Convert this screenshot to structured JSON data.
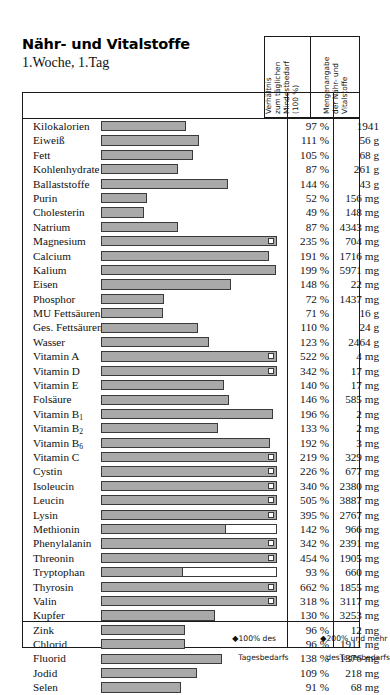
{
  "title": "Nähr- und Vitalstoffe",
  "subtitle": "1.Woche, 1.Tag",
  "columns": {
    "percent_header": "Verhältnis\nzum täglichen\nMindestbedarf\n(100 %)",
    "amount_header": "Mengenangabe\nder Nähr- und\nVitalstoffe"
  },
  "legend": {
    "marker_100": "◆",
    "text_100_line1": "100% des",
    "text_100_line2": "Tagesbedarfs",
    "marker_200": "◆",
    "text_200_line1": "200% und mehr",
    "text_200_line2": "desTagesbedarfs"
  },
  "colors": {
    "bar_fill": "#a9a9a9",
    "bar_stroke": "#3a3a3a",
    "frame": "#1a1a1a",
    "gridline": "#6b6b6b"
  },
  "chart_data": {
    "type": "bar",
    "title": "Nähr- und Vitalstoffe",
    "subtitle": "1.Woche, 1.Tag",
    "xlabel": "Verhältnis zum täglichen Mindestbedarf (100 %)",
    "ylabel": "",
    "xlim": [
      0,
      200
    ],
    "grid": true,
    "gridlines": [
      100,
      200
    ],
    "orientation": "horizontal",
    "categories": [
      "Kilokalorien",
      "Eiweiß",
      "Fett",
      "Kohlenhydrate",
      "Ballaststoffe",
      "Purin",
      "Cholesterin",
      "Natrium",
      "Magnesium",
      "Calcium",
      "Kalium",
      "Eisen",
      "Phosphor",
      "MU Fettsäuren",
      "Ges. Fettsäuren",
      "Wasser",
      "Vitamin A",
      "Vitamin D",
      "Vitamin E",
      "Folsäure",
      "Vitamin B1",
      "Vitamin B2",
      "Vitamin B6",
      "Vitamin C",
      "Cystin",
      "Isoleucin",
      "Leucin",
      "Lysin",
      "Methionin",
      "Phenylalanin",
      "Threonin",
      "Tryptophan",
      "Thyrosin",
      "Valin",
      "Kupfer",
      "Zink",
      "Chlorid",
      "Fluorid",
      "Jodid",
      "Selen"
    ],
    "values": [
      97,
      111,
      105,
      87,
      144,
      52,
      49,
      87,
      235,
      191,
      199,
      148,
      72,
      71,
      110,
      123,
      522,
      342,
      140,
      146,
      196,
      133,
      192,
      219,
      226,
      340,
      505,
      395,
      142,
      342,
      454,
      93,
      662,
      318,
      130,
      96,
      96,
      138,
      109,
      91
    ],
    "value_labels": [
      "97 %",
      "111 %",
      "105 %",
      "87 %",
      "144 %",
      "52 %",
      "49 %",
      "87 %",
      "235 %",
      "191 %",
      "199 %",
      "148 %",
      "72 %",
      "71 %",
      "110 %",
      "123 %",
      "522 %",
      "342 %",
      "140 %",
      "146 %",
      "196 %",
      "133 %",
      "192 %",
      "219 %",
      "226 %",
      "340 %",
      "505 %",
      "395 %",
      "142 %",
      "342 %",
      "454 %",
      "93 %",
      "662 %",
      "318 %",
      "130 %",
      "96 %",
      "96 %",
      "138 %",
      "109 %",
      "91 %"
    ],
    "amounts": [
      "1941",
      "56 g",
      "68 g",
      "261 g",
      "43 g",
      "156 mg",
      "148 mg",
      "4343 mg",
      "704 mg",
      "1716 mg",
      "5971 mg",
      "22 mg",
      "1437 mg",
      "16 g",
      "24 g",
      "2464 g",
      "4 mg",
      "17 mg",
      "17 mg",
      "585 mg",
      "2 mg",
      "2 mg",
      "3 mg",
      "329 mg",
      "677 mg",
      "2380 mg",
      "3887 mg",
      "2767 mg",
      "966 mg",
      "2391 mg",
      "1905 mg",
      "660 mg",
      "1855 mg",
      "3117 mg",
      "3253 mg",
      "12 mg",
      "1911 mg",
      "1376 mg",
      "218 mg",
      "68 mg"
    ]
  },
  "rows": [
    {
      "label": "Kilokalorien",
      "label_html": "Kilokalorien",
      "percent": 97,
      "percent_label": "97 %",
      "amount": "1941",
      "capped": false,
      "outline_full": false
    },
    {
      "label": "Eiweiß",
      "label_html": "Eiweiß",
      "percent": 111,
      "percent_label": "111 %",
      "amount": "56 g",
      "capped": false,
      "outline_full": false
    },
    {
      "label": "Fett",
      "label_html": "Fett",
      "percent": 105,
      "percent_label": "105 %",
      "amount": "68 g",
      "capped": false,
      "outline_full": false
    },
    {
      "label": "Kohlenhydrate",
      "label_html": "Kohlenhydrate",
      "percent": 87,
      "percent_label": "87 %",
      "amount": "261 g",
      "capped": false,
      "outline_full": false
    },
    {
      "label": "Ballaststoffe",
      "label_html": "Ballaststoffe",
      "percent": 144,
      "percent_label": "144 %",
      "amount": "43 g",
      "capped": false,
      "outline_full": false
    },
    {
      "label": "Purin",
      "label_html": "Purin",
      "percent": 52,
      "percent_label": "52 %",
      "amount": "156 mg",
      "capped": false,
      "outline_full": false
    },
    {
      "label": "Cholesterin",
      "label_html": "Cholesterin",
      "percent": 49,
      "percent_label": "49 %",
      "amount": "148 mg",
      "capped": false,
      "outline_full": false
    },
    {
      "label": "Natrium",
      "label_html": "Natrium",
      "percent": 87,
      "percent_label": "87 %",
      "amount": "4343 mg",
      "capped": false,
      "outline_full": false
    },
    {
      "label": "Magnesium",
      "label_html": "Magnesium",
      "percent": 235,
      "percent_label": "235 %",
      "amount": "704 mg",
      "capped": true,
      "outline_full": false
    },
    {
      "label": "Calcium",
      "label_html": "Calcium",
      "percent": 191,
      "percent_label": "191 %",
      "amount": "1716 mg",
      "capped": false,
      "outline_full": false
    },
    {
      "label": "Kalium",
      "label_html": "Kalium",
      "percent": 199,
      "percent_label": "199 %",
      "amount": "5971 mg",
      "capped": false,
      "outline_full": false
    },
    {
      "label": "Eisen",
      "label_html": "Eisen",
      "percent": 148,
      "percent_label": "148 %",
      "amount": "22 mg",
      "capped": false,
      "outline_full": false
    },
    {
      "label": "Phosphor",
      "label_html": "Phosphor",
      "percent": 72,
      "percent_label": "72 %",
      "amount": "1437 mg",
      "capped": false,
      "outline_full": false
    },
    {
      "label": "MU Fettsäuren",
      "label_html": "MU Fettsäuren",
      "percent": 71,
      "percent_label": "71 %",
      "amount": "16 g",
      "capped": false,
      "outline_full": false
    },
    {
      "label": "Ges. Fettsäuren",
      "label_html": "Ges. Fettsäuren",
      "percent": 110,
      "percent_label": "110 %",
      "amount": "24 g",
      "capped": false,
      "outline_full": false
    },
    {
      "label": "Wasser",
      "label_html": "Wasser",
      "percent": 123,
      "percent_label": "123 %",
      "amount": "2464 g",
      "capped": false,
      "outline_full": false
    },
    {
      "label": "Vitamin A",
      "label_html": "Vitamin A",
      "percent": 522,
      "percent_label": "522 %",
      "amount": "4 mg",
      "capped": true,
      "outline_full": false
    },
    {
      "label": "Vitamin D",
      "label_html": "Vitamin D",
      "percent": 342,
      "percent_label": "342 %",
      "amount": "17 mg",
      "capped": true,
      "outline_full": false
    },
    {
      "label": "Vitamin E",
      "label_html": "Vitamin E",
      "percent": 140,
      "percent_label": "140 %",
      "amount": "17 mg",
      "capped": false,
      "outline_full": false
    },
    {
      "label": "Folsäure",
      "label_html": "Folsäure",
      "percent": 146,
      "percent_label": "146 %",
      "amount": "585 mg",
      "capped": false,
      "outline_full": false
    },
    {
      "label": "Vitamin B1",
      "label_html": "Vitamin B<sub>1</sub>",
      "percent": 196,
      "percent_label": "196 %",
      "amount": "2 mg",
      "capped": false,
      "outline_full": false
    },
    {
      "label": "Vitamin B2",
      "label_html": "Vitamin B<sub>2</sub>",
      "percent": 133,
      "percent_label": "133 %",
      "amount": "2 mg",
      "capped": false,
      "outline_full": false
    },
    {
      "label": "Vitamin B6",
      "label_html": "Vitamin B<sub>6</sub>",
      "percent": 192,
      "percent_label": "192 %",
      "amount": "3 mg",
      "capped": false,
      "outline_full": false
    },
    {
      "label": "Vitamin C",
      "label_html": "Vitamin C",
      "percent": 219,
      "percent_label": "219 %",
      "amount": "329 mg",
      "capped": true,
      "outline_full": false
    },
    {
      "label": "Cystin",
      "label_html": "Cystin",
      "percent": 226,
      "percent_label": "226 %",
      "amount": "677 mg",
      "capped": true,
      "outline_full": false
    },
    {
      "label": "Isoleucin",
      "label_html": "Isoleucin",
      "percent": 340,
      "percent_label": "340 %",
      "amount": "2380 mg",
      "capped": true,
      "outline_full": false
    },
    {
      "label": "Leucin",
      "label_html": "Leucin",
      "percent": 505,
      "percent_label": "505 %",
      "amount": "3887 mg",
      "capped": true,
      "outline_full": false
    },
    {
      "label": "Lysin",
      "label_html": "Lysin",
      "percent": 395,
      "percent_label": "395 %",
      "amount": "2767 mg",
      "capped": true,
      "outline_full": false
    },
    {
      "label": "Methionin",
      "label_html": "Methionin",
      "percent": 142,
      "percent_label": "142 %",
      "amount": "966 mg",
      "capped": false,
      "outline_full": true
    },
    {
      "label": "Phenylalanin",
      "label_html": "Phenylalanin",
      "percent": 342,
      "percent_label": "342 %",
      "amount": "2391 mg",
      "capped": true,
      "outline_full": false
    },
    {
      "label": "Threonin",
      "label_html": "Threonin",
      "percent": 454,
      "percent_label": "454 %",
      "amount": "1905 mg",
      "capped": true,
      "outline_full": false
    },
    {
      "label": "Tryptophan",
      "label_html": "Tryptophan",
      "percent": 93,
      "percent_label": "93 %",
      "amount": "660 mg",
      "capped": false,
      "outline_full": true
    },
    {
      "label": "Thyrosin",
      "label_html": "Thyrosin",
      "percent": 662,
      "percent_label": "662 %",
      "amount": "1855 mg",
      "capped": true,
      "outline_full": false
    },
    {
      "label": "Valin",
      "label_html": "Valin",
      "percent": 318,
      "percent_label": "318 %",
      "amount": "3117 mg",
      "capped": true,
      "outline_full": false
    },
    {
      "label": "Kupfer",
      "label_html": "Kupfer",
      "percent": 130,
      "percent_label": "130 %",
      "amount": "3253 mg",
      "capped": false,
      "outline_full": false
    },
    {
      "label": "Zink",
      "label_html": "Zink",
      "percent": 96,
      "percent_label": "96 %",
      "amount": "12 mg",
      "capped": false,
      "outline_full": false
    },
    {
      "label": "Chlorid",
      "label_html": "Chlorid",
      "percent": 96,
      "percent_label": "96 %",
      "amount": "1911 mg",
      "capped": false,
      "outline_full": false
    },
    {
      "label": "Fluorid",
      "label_html": "Fluorid",
      "percent": 138,
      "percent_label": "138 %",
      "amount": "1376 mg",
      "capped": false,
      "outline_full": false
    },
    {
      "label": "Jodid",
      "label_html": "Jodid",
      "percent": 109,
      "percent_label": "109 %",
      "amount": "218 mg",
      "capped": false,
      "outline_full": false
    },
    {
      "label": "Selen",
      "label_html": "Selen",
      "percent": 91,
      "percent_label": "91 %",
      "amount": "68 mg",
      "capped": false,
      "outline_full": false
    }
  ]
}
